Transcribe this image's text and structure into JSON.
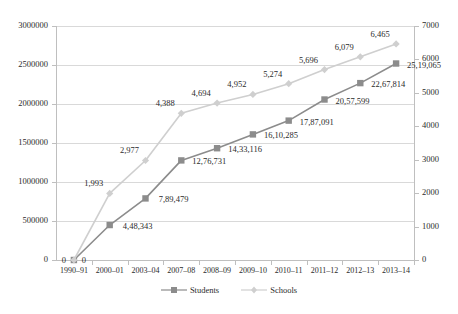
{
  "chart_data": {
    "type": "line",
    "title": "",
    "subtitle": "",
    "xlabel": "",
    "ylabel": "",
    "grid": true,
    "legend_position": "bottom",
    "categories": [
      "1990–91",
      "2000–01",
      "2003–04",
      "2007–08",
      "2008–09",
      "2009–10",
      "2010–11",
      "2011–12",
      "2012–13",
      "2013–14"
    ],
    "axes": {
      "left": {
        "name": "Students",
        "min": 0,
        "max": 3000000,
        "step": 500000,
        "ticks": [
          "0",
          "500000",
          "1000000",
          "1500000",
          "2000000",
          "2500000",
          "3000000"
        ],
        "tick_values": [
          0,
          500000,
          1000000,
          1500000,
          2000000,
          2500000,
          3000000
        ]
      },
      "right": {
        "name": "Schools",
        "min": 0,
        "max": 7000,
        "step": 1000,
        "ticks": [
          "0",
          "1000",
          "2000",
          "3000",
          "4000",
          "5000",
          "6000",
          "7000"
        ],
        "tick_values": [
          0,
          1000,
          2000,
          3000,
          4000,
          5000,
          6000,
          7000
        ]
      }
    },
    "series": [
      {
        "name": "Students",
        "axis": "left",
        "color": "#8c8c8c",
        "marker": "square",
        "values": [
          0,
          448343,
          789479,
          1276731,
          1433116,
          1610285,
          1787091,
          2057599,
          2267814,
          2519065
        ],
        "labels": [
          "0",
          "4,48,343",
          "7,89,479",
          "12,76,731",
          "14,33,116",
          "16,10,285",
          "17,87,091",
          "20,57,599",
          "22,67,814",
          "25,19,065"
        ]
      },
      {
        "name": "Schools",
        "axis": "right",
        "color": "#cfcfcf",
        "marker": "diamond",
        "values": [
          0,
          1993,
          2977,
          4388,
          4694,
          4952,
          5274,
          5696,
          6079,
          6465
        ],
        "labels": [
          "0",
          "1,993",
          "2,977",
          "4,388",
          "4,694",
          "4,952",
          "5,274",
          "5,696",
          "6,079",
          "6,465"
        ]
      }
    ]
  },
  "legend": {
    "items": [
      {
        "label": "Students"
      },
      {
        "label": "Schools"
      }
    ]
  }
}
